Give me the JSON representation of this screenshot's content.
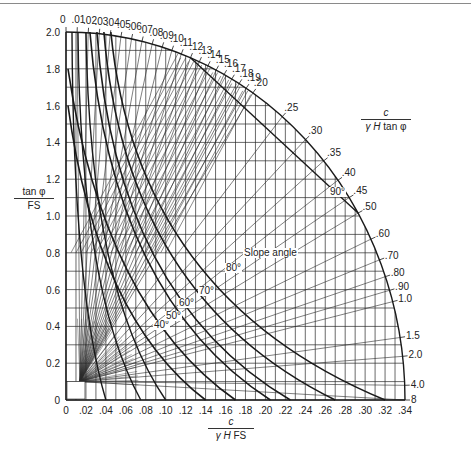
{
  "chart_data": {
    "type": "line",
    "xlabel": {
      "numerator": "c",
      "denominator_italic": "γ H",
      "denominator_rest": " FS"
    },
    "ylabel": {
      "numerator": "tan φ",
      "denominator": "FS"
    },
    "outer_scale_label": {
      "numerator": "c",
      "denominator_italic": "γ H",
      "denominator_rest": " tan φ"
    },
    "xlim": [
      0,
      0.34
    ],
    "ylim": [
      0,
      2.0
    ],
    "grid": true,
    "x_ticks": [
      "0",
      ".02",
      ".04",
      ".06",
      ".08",
      ".10",
      ".12",
      ".14",
      ".16",
      ".18",
      ".20",
      ".22",
      ".24",
      ".26",
      ".28",
      ".30",
      ".32",
      ".34"
    ],
    "x_tick_values": [
      0,
      0.02,
      0.04,
      0.06,
      0.08,
      0.1,
      0.12,
      0.14,
      0.16,
      0.18,
      0.2,
      0.22,
      0.24,
      0.26,
      0.28,
      0.3,
      0.32,
      0.34
    ],
    "y_ticks": [
      "0",
      "0.2",
      "0.4",
      "0.6",
      "0.8",
      "1.0",
      "1.2",
      "1.4",
      "1.6",
      "1.8",
      "2.0"
    ],
    "y_tick_values": [
      0,
      0.2,
      0.4,
      0.6,
      0.8,
      1.0,
      1.2,
      1.4,
      1.6,
      1.8,
      2.0
    ],
    "outer_ratio_ticks": [
      "0",
      ".01",
      ".02",
      ".03",
      ".04",
      ".05",
      ".06",
      ".07",
      ".08",
      ".09",
      ".10",
      ".11",
      ".12",
      ".13",
      ".14",
      ".15",
      ".16",
      ".17",
      ".18",
      ".19",
      ".20",
      ".25",
      ".30",
      ".35",
      ".40",
      ".45",
      ".50",
      ".60",
      ".70",
      ".80",
      ".90",
      "1.0",
      "1.5",
      "2.0",
      "4.0",
      "8"
    ],
    "outer_ratio_values": [
      0,
      0.01,
      0.02,
      0.03,
      0.04,
      0.05,
      0.06,
      0.07,
      0.08,
      0.09,
      0.1,
      0.11,
      0.12,
      0.13,
      0.14,
      0.15,
      0.16,
      0.17,
      0.18,
      0.19,
      0.2,
      0.25,
      0.3,
      0.35,
      0.4,
      0.45,
      0.5,
      0.6,
      0.7,
      0.8,
      0.9,
      1.0,
      1.5,
      2.0,
      4.0,
      8
    ],
    "slope_angle_label": "Slope angle",
    "series": [
      {
        "name": "40°",
        "label_pos": [
          0.095,
          0.56
        ],
        "x_intercept": 0.14,
        "y_intercept": 1.6
      },
      {
        "name": "50°",
        "label_pos": [
          0.105,
          0.6
        ],
        "x_intercept": 0.17,
        "y_intercept": 1.8
      },
      {
        "name": "60°",
        "label_pos": [
          0.115,
          0.66
        ],
        "x_intercept": 0.205,
        "y_intercept": 2.0
      },
      {
        "name": "70°",
        "label_pos": [
          0.135,
          0.73
        ],
        "x_intercept": 0.225,
        "y_intercept": 2.0
      },
      {
        "name": "80°",
        "label_pos": [
          0.165,
          0.86
        ],
        "x_intercept": 0.27,
        "y_intercept": 2.0
      },
      {
        "name": "90°",
        "label_pos": [
          0.225,
          1.24
        ],
        "x_intercept": 0.32,
        "y_intercept": 2.0
      }
    ],
    "annotations": [
      "40°",
      "50°",
      "60°",
      "70°",
      "80°",
      "90°",
      "Slope angle"
    ]
  },
  "labels": {
    "angle_40": "40°",
    "angle_50": "50°",
    "angle_60": "60°",
    "angle_70": "70°",
    "angle_80": "80°",
    "angle_90": "90°",
    "slope_angle": "Slope angle",
    "x_num": "c",
    "x_den_italic": "γ H",
    "x_den_rest": "FS",
    "y_num": "tan φ",
    "y_den": "FS",
    "r_num": "c",
    "r_den_italic": "γ H",
    "r_den_rest": "tan φ"
  },
  "colors": {
    "ink": "#1a1a1a",
    "grid": "#2a2a2a",
    "rule": "#8a8a8a",
    "background": "#ffffff"
  }
}
